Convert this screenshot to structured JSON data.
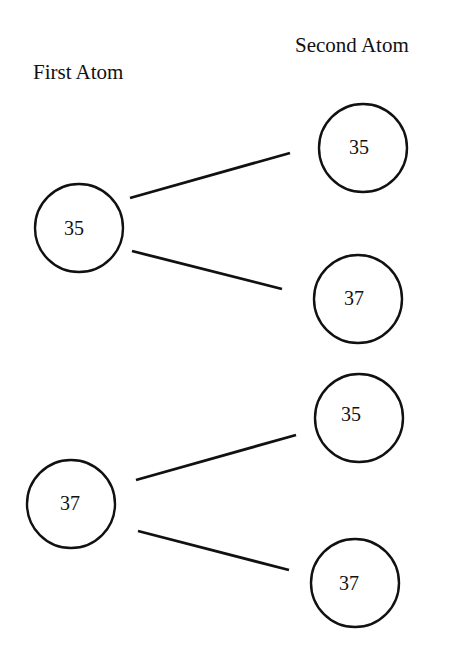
{
  "headers": {
    "first": "First Atom",
    "second": "Second Atom"
  },
  "nodes": {
    "first_35": "35",
    "first_37": "37",
    "second_35_a": "35",
    "second_37_a": "37",
    "second_35_b": "35",
    "second_37_b": "37"
  },
  "edges": [
    {
      "from": "first_35",
      "to": "second_35_a"
    },
    {
      "from": "first_35",
      "to": "second_37_a"
    },
    {
      "from": "first_37",
      "to": "second_35_b"
    },
    {
      "from": "first_37",
      "to": "second_37_b"
    }
  ],
  "colors": {
    "stroke": "#111111",
    "background": "#ffffff"
  }
}
